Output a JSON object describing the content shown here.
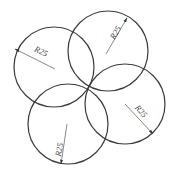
{
  "diagram": {
    "type": "technical-drawing",
    "line_color": "#3a3a3a",
    "background": "#ffffff",
    "common_point": {
      "x": 88,
      "y": 87
    },
    "circles": [
      {
        "id": "top-left",
        "cx": 54,
        "cy": 67,
        "r": 40,
        "dimension": {
          "label": "R25",
          "leader_from": {
            "x": 55,
            "y": 69
          },
          "leader_to": {
            "x": 15,
            "y": 49
          },
          "text_x": 40,
          "text_y": 54,
          "text_rotate": 25
        }
      },
      {
        "id": "top",
        "cx": 108,
        "cy": 51,
        "r": 40,
        "dimension": {
          "label": "R25",
          "leader_from": {
            "x": 106,
            "y": 54
          },
          "leader_to": {
            "x": 127,
            "y": 18
          },
          "text_x": 118,
          "text_y": 34,
          "text_rotate": -60
        }
      },
      {
        "id": "right",
        "cx": 125,
        "cy": 104,
        "r": 40,
        "dimension": {
          "label": "R25",
          "leader_from": {
            "x": 125,
            "y": 104
          },
          "leader_to": {
            "x": 153,
            "y": 134
          },
          "text_x": 139,
          "text_y": 113,
          "text_rotate": 48
        }
      },
      {
        "id": "bottom",
        "cx": 68,
        "cy": 124,
        "r": 40,
        "dimension": {
          "label": "R25",
          "leader_from": {
            "x": 67,
            "y": 124
          },
          "leader_to": {
            "x": 61,
            "y": 164
          },
          "text_x": 62,
          "text_y": 150,
          "text_rotate": -80
        }
      }
    ]
  }
}
